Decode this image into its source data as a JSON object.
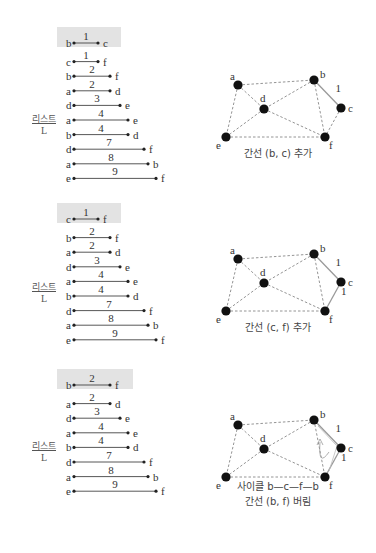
{
  "list_label": {
    "line1": "리스트",
    "line2": "L"
  },
  "panels": [
    {
      "list": [
        {
          "u": "b",
          "v": "c",
          "w": "1",
          "highlight": true
        },
        {
          "u": "c",
          "v": "f",
          "w": "1"
        },
        {
          "u": "b",
          "v": "f",
          "w": "2"
        },
        {
          "u": "a",
          "v": "d",
          "w": "2"
        },
        {
          "u": "d",
          "v": "e",
          "w": "3"
        },
        {
          "u": "a",
          "v": "e",
          "w": "4"
        },
        {
          "u": "b",
          "v": "d",
          "w": "4"
        },
        {
          "u": "d",
          "v": "f",
          "w": "7"
        },
        {
          "u": "a",
          "v": "b",
          "w": "8"
        },
        {
          "u": "e",
          "v": "f",
          "w": "9"
        }
      ],
      "graph": {
        "solid_edges": [
          {
            "u": "b",
            "v": "c",
            "w": "1"
          }
        ],
        "caption": [
          "간선 (b, c) 추가"
        ],
        "cycle_arrow": false
      }
    },
    {
      "list": [
        {
          "u": "c",
          "v": "f",
          "w": "1",
          "highlight": true
        },
        {
          "u": "b",
          "v": "f",
          "w": "2"
        },
        {
          "u": "a",
          "v": "d",
          "w": "2"
        },
        {
          "u": "d",
          "v": "e",
          "w": "3"
        },
        {
          "u": "a",
          "v": "e",
          "w": "4"
        },
        {
          "u": "b",
          "v": "d",
          "w": "4"
        },
        {
          "u": "d",
          "v": "f",
          "w": "7"
        },
        {
          "u": "a",
          "v": "b",
          "w": "8"
        },
        {
          "u": "e",
          "v": "f",
          "w": "9"
        }
      ],
      "graph": {
        "solid_edges": [
          {
            "u": "b",
            "v": "c",
            "w": "1"
          },
          {
            "u": "c",
            "v": "f",
            "w": "1"
          }
        ],
        "caption": [
          "간선 (c, f) 추가"
        ],
        "cycle_arrow": false
      }
    },
    {
      "list": [
        {
          "u": "b",
          "v": "f",
          "w": "2",
          "highlight": true
        },
        {
          "u": "a",
          "v": "d",
          "w": "2"
        },
        {
          "u": "d",
          "v": "e",
          "w": "3"
        },
        {
          "u": "a",
          "v": "e",
          "w": "4"
        },
        {
          "u": "b",
          "v": "d",
          "w": "4"
        },
        {
          "u": "d",
          "v": "f",
          "w": "7"
        },
        {
          "u": "a",
          "v": "b",
          "w": "8"
        },
        {
          "u": "e",
          "v": "f",
          "w": "9"
        }
      ],
      "graph": {
        "solid_edges": [
          {
            "u": "b",
            "v": "c",
            "w": "1"
          },
          {
            "u": "c",
            "v": "f",
            "w": "1"
          }
        ],
        "caption": [
          "사이클 b—c—f—b",
          "간선 (b, f) 버림"
        ],
        "cycle_arrow": true
      }
    }
  ],
  "graph_nodes": {
    "a": [
      38,
      25
    ],
    "b": [
      114,
      20
    ],
    "c": [
      141,
      48
    ],
    "d": [
      64,
      49
    ],
    "e": [
      26,
      77
    ],
    "f": [
      125,
      77
    ]
  },
  "graph_label_offsets": {
    "a": [
      -8,
      -5
    ],
    "b": [
      6,
      -2
    ],
    "c": [
      7,
      4
    ],
    "d": [
      -4,
      -7
    ],
    "e": [
      -10,
      12
    ],
    "f": [
      4,
      12
    ]
  },
  "dashed_edges": [
    [
      "a",
      "b"
    ],
    [
      "a",
      "d"
    ],
    [
      "a",
      "e"
    ],
    [
      "b",
      "d"
    ],
    [
      "b",
      "f"
    ],
    [
      "c",
      "f"
    ],
    [
      "d",
      "e"
    ],
    [
      "d",
      "f"
    ],
    [
      "e",
      "f"
    ]
  ],
  "colors": {
    "node": "#111111",
    "dashed_edge": "#888888",
    "solid_edge": "#999999",
    "highlight_bg": "#e3e3e3",
    "text": "#333333"
  }
}
